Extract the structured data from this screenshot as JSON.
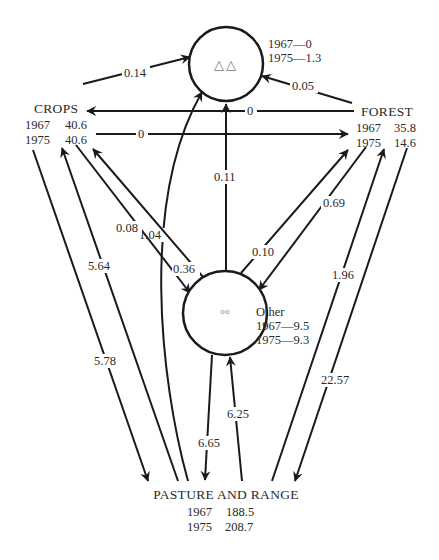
{
  "nodes": {
    "top": {
      "symbol": "△△",
      "line1": "1967—0",
      "line2": "1975—1.3"
    },
    "crops": {
      "name": "CROPS",
      "y1967_label": "1967",
      "y1967_value": "40.6",
      "y1975_label": "1975",
      "y1975_value": "40.6"
    },
    "forest": {
      "name": "FOREST",
      "y1967_label": "1967",
      "y1967_value": "35.8",
      "y1975_label": "1975",
      "y1975_value": "14.6"
    },
    "other": {
      "symbol": "°°",
      "name": "Other",
      "line1": "1967—9.5",
      "line2": "1975—9.3"
    },
    "pasture": {
      "name": "PASTURE AND RANGE",
      "y1967_label": "1967",
      "y1967_value": "188.5",
      "y1975_label": "1975",
      "y1975_value": "208.7"
    }
  },
  "edges": {
    "crops_to_top": "0.14",
    "forest_to_top": "0.05",
    "forest_to_crops": "0",
    "crops_to_forest": "0",
    "pasture_to_top": "1.04",
    "other_to_top": "0.11",
    "crops_to_other": "0.08",
    "other_to_crops": "0.36",
    "other_to_forest": "0.10",
    "forest_to_other": "0.69",
    "pasture_to_crops": "5.64",
    "crops_to_pasture": "5.78",
    "other_to_pasture": "6.65",
    "pasture_to_other": "6.25",
    "pasture_to_forest": "1.96",
    "forest_to_pasture": "22.57"
  }
}
